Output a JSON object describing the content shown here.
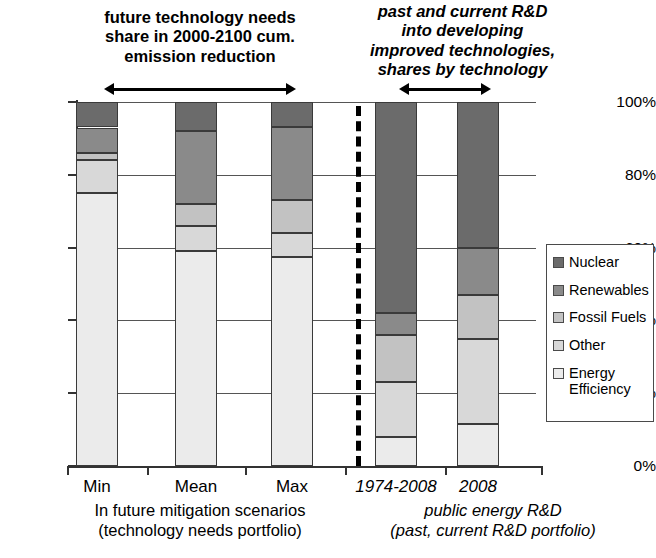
{
  "annotations": {
    "left": {
      "lines": [
        "future technology needs",
        "share in 2000-2100 cum.",
        "emission reduction"
      ]
    },
    "right": {
      "lines": [
        "past and current R&D",
        "into developing",
        "improved technologies,",
        "shares by technology"
      ]
    }
  },
  "axis": {
    "y_ticks": [
      "0%",
      "20%",
      "40%",
      "60%",
      "80%",
      "100%"
    ],
    "y_tick_values": [
      0,
      20,
      40,
      60,
      80,
      100
    ]
  },
  "groups": [
    {
      "caption_lines": [
        "In future mitigation scenarios",
        "(technology needs portfolio)"
      ],
      "italic": false
    },
    {
      "caption_lines": [
        "public energy R&D",
        "(past, current R&D portfolio)"
      ],
      "italic": true
    }
  ],
  "legend": {
    "items": [
      {
        "label": "Nuclear",
        "color": "#6b6b6b"
      },
      {
        "label": "Renewables",
        "color": "#8a8a8a"
      },
      {
        "label": "Fossil Fuels",
        "color": "#c2c2c2"
      },
      {
        "label": "Other",
        "color": "#d8d8d8"
      },
      {
        "label": "Energy\nEfficiency",
        "color": "#ebebeb"
      }
    ]
  },
  "chart_data": {
    "type": "bar",
    "title": "",
    "xlabel": "",
    "ylabel": "",
    "ylim": [
      0,
      100
    ],
    "stacked": true,
    "grid": true,
    "legend_position": "right",
    "categories": [
      "Min",
      "Mean",
      "Max",
      "1974-2008",
      "2008"
    ],
    "category_styles": [
      "normal",
      "normal",
      "normal",
      "italic",
      "italic"
    ],
    "series": [
      {
        "name": "Energy Efficiency",
        "color": "#ebebeb",
        "values": [
          75,
          59,
          57.5,
          8,
          11.5
        ]
      },
      {
        "name": "Other",
        "color": "#d8d8d8",
        "values": [
          9,
          7,
          6.5,
          15,
          23.5
        ]
      },
      {
        "name": "Fossil Fuels",
        "color": "#c2c2c2",
        "values": [
          2,
          6,
          9,
          13,
          12
        ]
      },
      {
        "name": "Renewables",
        "color": "#8a8a8a",
        "values": [
          7,
          20,
          20,
          6,
          13
        ]
      },
      {
        "name": "Nuclear",
        "color": "#6b6b6b",
        "values": [
          7,
          8,
          7,
          58,
          40
        ]
      }
    ]
  }
}
